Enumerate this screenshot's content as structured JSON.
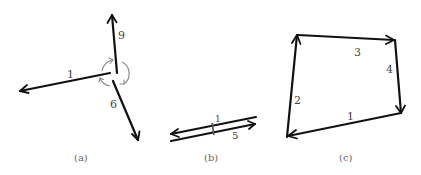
{
  "figure": {
    "panels": [
      {
        "id": "a",
        "caption": "(a)",
        "description": "Three vectors emanating from a common point with rotation arcs at the joint",
        "vectors": [
          {
            "label": "9",
            "direction": "up"
          },
          {
            "label": "1",
            "direction": "left"
          },
          {
            "label": "6",
            "direction": "down-right"
          }
        ],
        "rotation_arcs": 3
      },
      {
        "id": "b",
        "caption": "(b)",
        "description": "Two nearly coincident antiparallel vectors joined by a small tick",
        "vectors": [
          {
            "label": "1",
            "direction": "left"
          },
          {
            "label": "5",
            "direction": "right"
          }
        ]
      },
      {
        "id": "c",
        "caption": "(c)",
        "description": "Closed quadrilateral loop of four head-to-tail vectors",
        "vectors": [
          {
            "label": "1",
            "direction": "bottom-right to bottom-left"
          },
          {
            "label": "2",
            "direction": "bottom-left to top-left"
          },
          {
            "label": "3",
            "direction": "top-left to top-right"
          },
          {
            "label": "4",
            "direction": "top-right to bottom-right"
          }
        ]
      }
    ],
    "colors": {
      "vector": "#111111",
      "arc": "#8a8a8a",
      "label": "#444444",
      "caption": "#666666"
    }
  }
}
